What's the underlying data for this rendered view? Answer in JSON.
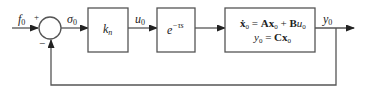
{
  "diagram": {
    "type": "block-diagram",
    "title": "",
    "input_label": "f",
    "input_sub": "0",
    "summing_junction": {
      "plus_sign": "+",
      "minus_sign": "−"
    },
    "error_label": "σ",
    "error_sub": "0",
    "blocks": [
      {
        "id": "gain",
        "main": "k",
        "sub": "n"
      },
      {
        "id": "delay",
        "main": "e",
        "sup": "−τs"
      },
      {
        "id": "plant",
        "line1": {
          "xdot": "ẋ",
          "sub0": "0",
          "eq": " = ",
          "A": "A",
          "x": "x",
          "sub1": "0",
          "plus": " + ",
          "B": "B",
          "u": "u",
          "sub2": "0"
        },
        "line2": {
          "y": "y",
          "sub0": "0",
          "eq": " = ",
          "C": "C",
          "x": "x",
          "sub1": "0"
        }
      }
    ],
    "control_label": "u",
    "control_sub": "0",
    "output_label": "y",
    "output_sub": "0"
  }
}
